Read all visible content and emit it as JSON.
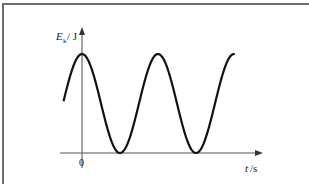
{
  "chart_data": {
    "type": "line",
    "title": "",
    "xlabel": "t/s",
    "ylabel": "E_k/J",
    "ylabel_main": "E",
    "ylabel_sub": "k",
    "ylabel_unit": "/ J",
    "xlabel_italic": "t",
    "xlabel_unit": "/s",
    "x_ticks": [
      "0"
    ],
    "series": [
      {
        "name": "Ek",
        "x_periods": [
          -0.24,
          0,
          0.5,
          1.0,
          1.5,
          2.0
        ],
        "y_normalized": [
          0.5,
          1.0,
          0.0,
          1.0,
          0.0,
          1.0
        ]
      }
    ],
    "grid": false,
    "legend": null,
    "colors": {
      "curve": "#111111",
      "axis": "#555555",
      "frame": "#6e6e6e"
    }
  }
}
